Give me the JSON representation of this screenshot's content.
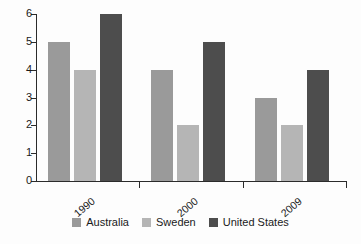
{
  "chart_data": {
    "type": "bar",
    "title": "",
    "subtitle": "",
    "xlabel": "",
    "ylabel": "",
    "categories": [
      "1990",
      "2000",
      "2009"
    ],
    "series": [
      {
        "name": "Australia",
        "color": "#9a9a9a",
        "values": [
          5,
          4,
          3
        ]
      },
      {
        "name": "Sweden",
        "color": "#b5b5b5",
        "values": [
          4,
          2,
          2
        ]
      },
      {
        "name": "United States",
        "color": "#4d4d4d",
        "values": [
          6,
          5,
          4
        ]
      }
    ],
    "ylim": [
      0,
      6
    ],
    "ytick_labels": [
      "0",
      "1",
      "2",
      "3",
      "4",
      "5",
      "6"
    ],
    "ytick_values": [
      0,
      1,
      2,
      3,
      4,
      5,
      6
    ],
    "grid": false,
    "legend_position": "bottom",
    "tick_label_rotation": -40,
    "background_color": "#fdfdfd",
    "axis_color": "#2b2b2b"
  }
}
